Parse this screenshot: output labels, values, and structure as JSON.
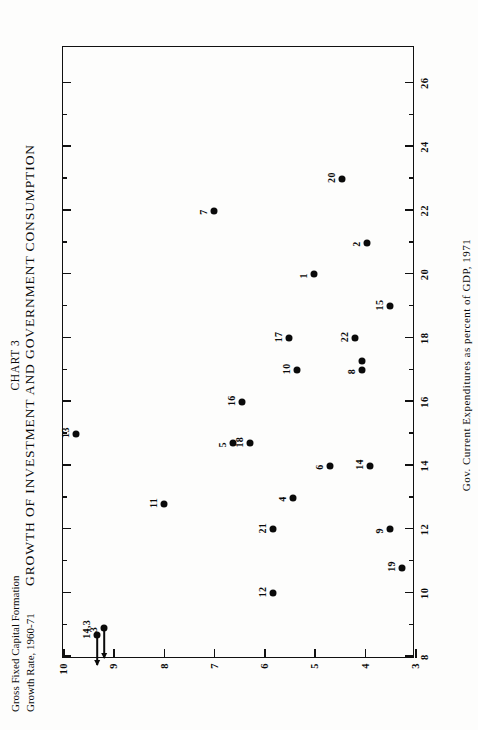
{
  "title": {
    "line1": "CHART 3",
    "line2": "GROWTH OF INVESTMENT AND GOVERNMENT CONSUMPTION"
  },
  "axis_label_y": {
    "line1": "Gross Fixed Capital Formation",
    "line2": "Growth Rate, 1960-71"
  },
  "axis_label_x": "Gov. Current Expenditures as percent of GDP, 1971",
  "chart_data": {
    "type": "scatter",
    "xlabel": "Gov. Current Expenditures as percent of GDP, 1971",
    "ylabel": "Gross Fixed Capital Formation Growth Rate, 1960-71",
    "xlim": [
      8,
      27.2
    ],
    "ylim": [
      3,
      10
    ],
    "grid": false,
    "legend": "none",
    "orientation": "page-rotated-90-ccw",
    "xticks": [
      8,
      10,
      12,
      14,
      16,
      18,
      20,
      22,
      24,
      26
    ],
    "xticklabels": [
      "8",
      "10",
      "12",
      "14",
      "16",
      "18",
      "20",
      "22",
      "24",
      "26"
    ],
    "xminorticks": [
      9,
      11,
      13,
      15,
      17,
      19,
      21,
      23,
      25
    ],
    "yticks": [
      3,
      4,
      5,
      6,
      7,
      8,
      9,
      10
    ],
    "yticklabels": [
      "3",
      "4",
      "5",
      "6",
      "7",
      "8",
      "9",
      "10"
    ],
    "points": [
      {
        "label": "13",
        "x": 15.0,
        "y": 9.75
      },
      {
        "label": "14,3",
        "x": 8.7,
        "y": 9.32,
        "arrow": "left"
      },
      {
        "label": "3",
        "x": 8.9,
        "y": 9.18,
        "arrow": "left"
      },
      {
        "label": "11",
        "x": 12.8,
        "y": 8.0
      },
      {
        "label": "7",
        "x": 22.0,
        "y": 7.0
      },
      {
        "label": "5",
        "x": 14.7,
        "y": 6.62
      },
      {
        "label": "16",
        "x": 16.0,
        "y": 6.45
      },
      {
        "label": "18",
        "x": 14.7,
        "y": 6.28
      },
      {
        "label": "12",
        "x": 10.0,
        "y": 5.83
      },
      {
        "label": "21",
        "x": 12.0,
        "y": 5.83
      },
      {
        "label": "17",
        "x": 18.0,
        "y": 5.5
      },
      {
        "label": "10",
        "x": 17.0,
        "y": 5.35
      },
      {
        "label": "1",
        "x": 20.0,
        "y": 5.0
      },
      {
        "label": "4",
        "x": 13.0,
        "y": 5.42
      },
      {
        "label": "6",
        "x": 14.0,
        "y": 4.7
      },
      {
        "label": "20",
        "x": 23.0,
        "y": 4.45
      },
      {
        "label": "22",
        "x": 18.0,
        "y": 4.2
      },
      {
        "label": "2",
        "x": 21.0,
        "y": 3.95
      },
      {
        "label": "8",
        "x": 17.0,
        "y": 4.05
      },
      {
        "label": "",
        "x": 17.3,
        "y": 4.05
      },
      {
        "label": "14",
        "x": 14.0,
        "y": 3.9
      },
      {
        "label": "15",
        "x": 19.0,
        "y": 3.5
      },
      {
        "label": "9",
        "x": 12.0,
        "y": 3.5
      },
      {
        "label": "19",
        "x": 10.8,
        "y": 3.25
      }
    ]
  }
}
